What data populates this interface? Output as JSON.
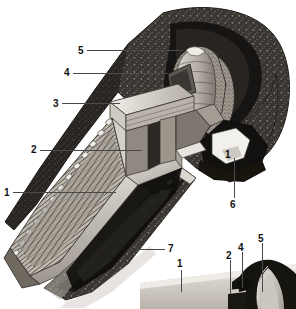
{
  "figure": {
    "background_color": "#ffffff",
    "ink_color": "#111111",
    "leader_color": "#4a4a4a",
    "width": 296,
    "height": 309
  },
  "main_view": {
    "name": "main-cutaway-view",
    "description": "Sectioned perspective view of a corbel-vaulted tholos tomb cut through the dromos, stomion and chamber",
    "callouts": [
      {
        "id": "c5",
        "label": "5",
        "x": 78,
        "y": 46,
        "leader": {
          "type": "h",
          "x1": 87,
          "x2": 183,
          "y": 50
        },
        "target": "corbelled-vault-dome"
      },
      {
        "id": "c4",
        "label": "4",
        "x": 64,
        "y": 68,
        "leader": {
          "type": "h",
          "x1": 73,
          "x2": 168,
          "y": 73
        },
        "target": "relieving-triangle"
      },
      {
        "id": "c3",
        "label": "3",
        "x": 53,
        "y": 99,
        "leader": {
          "type": "h",
          "x1": 62,
          "x2": 120,
          "y": 103
        },
        "target": "lintel-block"
      },
      {
        "id": "c2",
        "label": "2",
        "x": 31,
        "y": 145,
        "leader": {
          "type": "h",
          "x1": 40,
          "x2": 142,
          "y": 150
        },
        "target": "stomion-doorway"
      },
      {
        "id": "c1l",
        "label": "1",
        "x": 4,
        "y": 188,
        "leader": {
          "type": "h",
          "x1": 13,
          "x2": 116,
          "y": 192
        },
        "target": "dromos-passage"
      },
      {
        "id": "c1r",
        "label": "1",
        "x": 225,
        "y": 150,
        "leader": {
          "type": "none"
        },
        "target": "dromos-passage"
      },
      {
        "id": "c6",
        "label": "6",
        "x": 230,
        "y": 205,
        "leader": {
          "type": "v",
          "x": 234,
          "y1": 158,
          "y2": 198
        },
        "target": "burial-pit"
      },
      {
        "id": "c7",
        "label": "7",
        "x": 168,
        "y": 244,
        "leader": {
          "type": "h",
          "x1": 140,
          "x2": 165,
          "y": 249
        },
        "target": "tumulus-mound-earth"
      },
      {
        "id": "c1b",
        "label": "1",
        "x": 177,
        "y": 259,
        "leader": {
          "type": "v",
          "x": 181,
          "y1": 270,
          "y2": 292
        },
        "target": "dromos-passage"
      }
    ]
  },
  "inset_view": {
    "name": "detail-inset-view",
    "description": "Small elevation detail of the facade showing doorway, relieving triangle and dome profile",
    "callouts": [
      {
        "id": "i2",
        "label": "2",
        "x": 226,
        "y": 253,
        "leader": {
          "type": "v",
          "x": 230,
          "y1": 260,
          "y2": 294
        },
        "target": "stomion-doorway"
      },
      {
        "id": "i4",
        "label": "4",
        "x": 238,
        "y": 244,
        "leader": {
          "type": "v",
          "x": 242,
          "y1": 252,
          "y2": 288
        },
        "target": "relieving-triangle"
      },
      {
        "id": "i5",
        "label": "5",
        "x": 258,
        "y": 235,
        "leader": {
          "type": "v",
          "x": 262,
          "y1": 243,
          "y2": 292
        },
        "target": "corbelled-vault-dome"
      }
    ]
  },
  "legend_keys": {
    "1": "dromos (entrance passage)",
    "2": "stomion (doorway)",
    "3": "lintel",
    "4": "relieving triangle",
    "5": "corbelled vault / dome",
    "6": "burial pit",
    "7": "tumulus (earth mound)"
  }
}
